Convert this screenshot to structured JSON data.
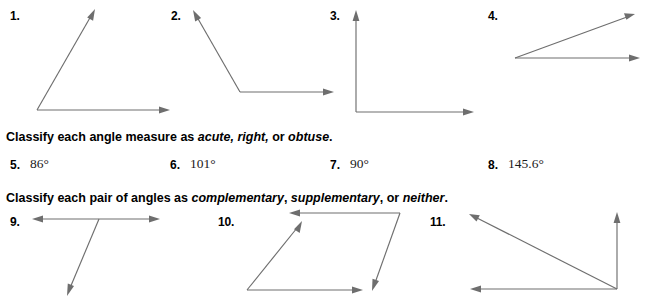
{
  "page": {
    "background_color": "#ffffff",
    "line_color": "#6e6e6e",
    "text_color": "#000000"
  },
  "figures_row1": [
    {
      "label": "1.",
      "kind": "acute-angle-open-up-right"
    },
    {
      "label": "2.",
      "kind": "obtuse-angle-open-right"
    },
    {
      "label": "3.",
      "kind": "right-angle"
    },
    {
      "label": "4.",
      "kind": "acute-angle-narrow"
    }
  ],
  "instruction1": {
    "parts": [
      {
        "text": "Classify each angle measure as ",
        "italic": false
      },
      {
        "text": "acute,",
        "italic": true
      },
      {
        "text": " ",
        "italic": false
      },
      {
        "text": "right,",
        "italic": true
      },
      {
        "text": " or ",
        "italic": false
      },
      {
        "text": "obtuse",
        "italic": true
      },
      {
        "text": ".",
        "italic": false
      }
    ],
    "plain": "Classify each angle measure as acute, right, or obtuse."
  },
  "measures": [
    {
      "number": "5.",
      "value": "86°"
    },
    {
      "number": "6.",
      "value": "101°"
    },
    {
      "number": "7.",
      "value": "90°"
    },
    {
      "number": "8.",
      "value": "145.6°"
    }
  ],
  "instruction2": {
    "parts": [
      {
        "text": "Classify each pair of angles as ",
        "italic": false
      },
      {
        "text": "complementary",
        "italic": true
      },
      {
        "text": ", ",
        "italic": false
      },
      {
        "text": "supplementary",
        "italic": true
      },
      {
        "text": ", or ",
        "italic": false
      },
      {
        "text": "neither",
        "italic": true
      },
      {
        "text": ".",
        "italic": false
      }
    ],
    "plain": "Classify each pair of angles as complementary, supplementary, or neither."
  },
  "figures_row2": [
    {
      "label": "9.",
      "kind": "line-with-ray-pair"
    },
    {
      "label": "10.",
      "kind": "parallelogram-angle-pair"
    },
    {
      "label": "11.",
      "kind": "triangle-vertex-angle-pair"
    }
  ]
}
